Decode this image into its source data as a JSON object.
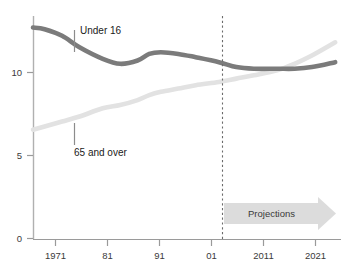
{
  "chart_data": {
    "type": "line",
    "title": "",
    "subtitle": "",
    "xlabel": "",
    "ylabel": "",
    "xlim": [
      1969,
      2022
    ],
    "ylim": [
      0,
      13.5
    ],
    "yticks": [
      0,
      5,
      10
    ],
    "ytick_labels": [
      "0",
      "5",
      "10"
    ],
    "xticks": [
      1971,
      1981,
      1991,
      2001,
      2011,
      2021
    ],
    "xtick_labels": [
      "1971",
      "81",
      "91",
      "01",
      "2011",
      "2021"
    ],
    "grid": false,
    "legend_position": "inline-annotations",
    "units": "millions",
    "series": [
      {
        "name": "Under 16",
        "color": "#7b7b7b",
        "label_text": "Under 16",
        "x": [
          1969,
          1971,
          1974,
          1977,
          1981,
          1984,
          1987,
          1989,
          1991,
          1994,
          1997,
          2001,
          2004,
          2007,
          2011,
          2014,
          2017,
          2021
        ],
        "values": [
          12.8,
          12.7,
          12.3,
          11.6,
          10.9,
          10.6,
          10.8,
          11.2,
          11.3,
          11.2,
          11.0,
          10.7,
          10.4,
          10.3,
          10.3,
          10.3,
          10.4,
          10.7
        ]
      },
      {
        "name": "65 and over",
        "color": "#e2e2e2",
        "label_text": "65 and over",
        "x": [
          1969,
          1971,
          1974,
          1977,
          1981,
          1984,
          1987,
          1989,
          1991,
          1994,
          1997,
          2001,
          2004,
          2007,
          2011,
          2014,
          2017,
          2021
        ],
        "values": [
          6.6,
          6.8,
          7.1,
          7.4,
          7.9,
          8.1,
          8.4,
          8.7,
          8.9,
          9.1,
          9.3,
          9.5,
          9.7,
          9.9,
          10.2,
          10.6,
          11.1,
          11.9
        ]
      }
    ],
    "annotations": [
      {
        "name": "projections-divider",
        "type": "vertical-dashed-line",
        "x": 2003,
        "color": "#6b6b6b"
      },
      {
        "name": "projections-arrow",
        "type": "arrow-band",
        "label": "Projections",
        "x_start": 2003,
        "x_end": 2022,
        "color": "#dcdcdc"
      }
    ]
  },
  "labels": {
    "under16": "Under 16",
    "over65": "65 and over",
    "projections": "Projections"
  },
  "ytick_labels": {
    "t0": "0",
    "t1": "5",
    "t2": "10"
  },
  "xtick_labels": {
    "t0": "1971",
    "t1": "81",
    "t2": "91",
    "t3": "01",
    "t4": "2011",
    "t5": "2021"
  }
}
